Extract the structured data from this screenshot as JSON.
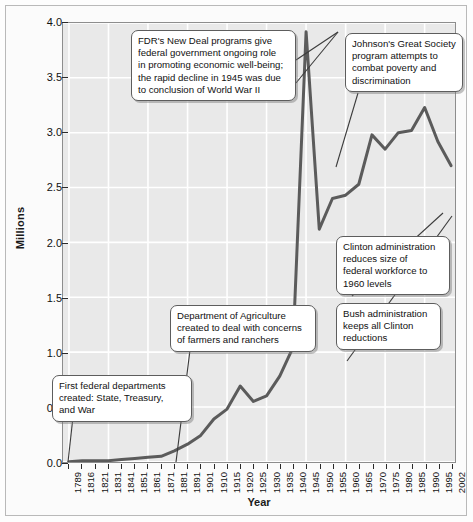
{
  "chart_data": {
    "type": "line",
    "title": "",
    "xlabel": "Year",
    "ylabel": "Millions",
    "ylim": [
      0.0,
      4.0
    ],
    "ytick_labels": [
      "0.0",
      "0.5",
      "1.0",
      "1.5",
      "2.0",
      "2.5",
      "3.0",
      "3.5",
      "4.0"
    ],
    "ytick_values": [
      0.0,
      0.5,
      1.0,
      1.5,
      2.0,
      2.5,
      3.0,
      3.5,
      4.0
    ],
    "grid": true,
    "legend": "none",
    "line_color": "#5b5b5b",
    "categories": [
      "1789",
      "1816",
      "1821",
      "1831",
      "1841",
      "1851",
      "1861",
      "1871",
      "1881",
      "1891",
      "1901",
      "1910",
      "1915",
      "1920",
      "1925",
      "1930",
      "1935",
      "1940",
      "1945",
      "1950",
      "1955",
      "1960",
      "1965",
      "1970",
      "1975",
      "1980",
      "1985",
      "1990",
      "1995",
      "2002"
    ],
    "values": [
      0.0,
      0.01,
      0.01,
      0.01,
      0.02,
      0.03,
      0.04,
      0.05,
      0.1,
      0.16,
      0.24,
      0.39,
      0.48,
      0.69,
      0.55,
      0.6,
      0.78,
      1.04,
      3.92,
      2.12,
      2.4,
      2.43,
      2.53,
      2.98,
      2.85,
      3.0,
      3.02,
      3.23,
      2.92,
      2.7
    ],
    "annotations": [
      {
        "id": "fdr",
        "text": "FDR's New Deal programs give federal government ongoing role in promoting economic well-being; the rapid decline in 1945 was due to conclusion of World War II"
      },
      {
        "id": "johnson",
        "text": "Johnson's Great Society program attempts to combat poverty and discrimination"
      },
      {
        "id": "clinton",
        "text": "Clinton administration reduces size of federal workforce to 1960 levels"
      },
      {
        "id": "bush",
        "text": "Bush administration keeps all Clinton reductions"
      },
      {
        "id": "agriculture",
        "text": "Department of Agriculture created to deal with concerns of farmers and ranchers"
      },
      {
        "id": "first-departments",
        "text": "First federal departments created: State, Treasury, and War"
      }
    ]
  },
  "axes": {
    "y_title": "Millions",
    "x_title": "Year"
  },
  "callouts": {
    "fdr": {
      "line1": "FDR's New Deal programs give",
      "line2": "federal government ongoing role",
      "line3": "in promoting economic well-being;",
      "line4": "the rapid decline in 1945 was due",
      "line5": "to conclusion of World War II"
    },
    "johnson": {
      "line1": "Johnson's Great Society",
      "line2": "program attempts to",
      "line3": "combat poverty and",
      "line4": "discrimination"
    },
    "clinton": {
      "line1": "Clinton administration",
      "line2": "reduces size of",
      "line3": "federal workforce to",
      "line4": "1960 levels"
    },
    "bush": {
      "line1": "Bush administration",
      "line2": "keeps all Clinton",
      "line3": "reductions"
    },
    "agriculture": {
      "line1": "Department of Agriculture",
      "line2": "created to deal with concerns",
      "line3": "of farmers and ranchers"
    },
    "first_departments": {
      "line1": "First federal departments",
      "line2": "created: State, Treasury,",
      "line3": "and War"
    }
  }
}
